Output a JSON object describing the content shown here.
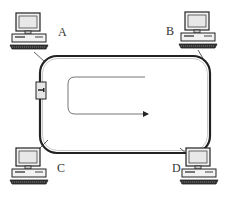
{
  "diagram": {
    "type": "token-ring-network",
    "nodes": [
      {
        "id": "A",
        "label": "A",
        "position": "top-left"
      },
      {
        "id": "B",
        "label": "B",
        "position": "top-right"
      },
      {
        "id": "C",
        "label": "C",
        "position": "bottom-left"
      },
      {
        "id": "D",
        "label": "D",
        "position": "bottom-right"
      }
    ],
    "ring": {
      "shape": "rounded-rectangle",
      "stroke": "#333333"
    },
    "direction_arrow": "clockwise",
    "token_device": "left-side",
    "caption": ""
  }
}
